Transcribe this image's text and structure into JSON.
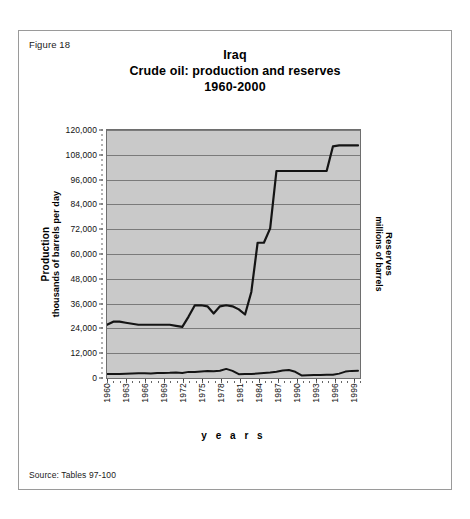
{
  "figure": {
    "label": "Figure 18",
    "source": "Source: Tables 97-100"
  },
  "chart_data": {
    "type": "line",
    "title": "Iraq",
    "subtitle": "Crude oil: production and reserves",
    "period": "1960-2000",
    "xlabel": "y e a r s",
    "ylabel_line1": "Production",
    "ylabel_line2": "thousands of barrels per day",
    "y2label_line1": "Reserves",
    "y2label_line2": "millions of barrels",
    "grid": true,
    "legend": "none",
    "xlim": [
      1960,
      2000
    ],
    "ylim": [
      0,
      120000
    ],
    "ytick_labels": [
      "0",
      "12,000",
      "24,000",
      "36,000",
      "48,000",
      "60,000",
      "72,000",
      "84,000",
      "96,000",
      "108,000",
      "120,000"
    ],
    "ytick_values": [
      0,
      12000,
      24000,
      36000,
      48000,
      60000,
      72000,
      84000,
      96000,
      108000,
      120000
    ],
    "xtick_labels": [
      "1960",
      "1963",
      "1966",
      "1969",
      "1972",
      "1975",
      "1978",
      "1981",
      "1984",
      "1987",
      "1990",
      "1993",
      "1996",
      "1999"
    ],
    "xtick_values": [
      1960,
      1963,
      1966,
      1969,
      1972,
      1975,
      1978,
      1981,
      1984,
      1987,
      1990,
      1993,
      1996,
      1999
    ],
    "x": [
      1960,
      1961,
      1962,
      1963,
      1964,
      1965,
      1966,
      1967,
      1968,
      1969,
      1970,
      1971,
      1972,
      1973,
      1974,
      1975,
      1976,
      1977,
      1978,
      1979,
      1980,
      1981,
      1982,
      1983,
      1984,
      1985,
      1986,
      1987,
      1988,
      1989,
      1990,
      1991,
      1992,
      1993,
      1994,
      1995,
      1996,
      1997,
      1998,
      1999,
      2000
    ],
    "series": [
      {
        "name": "Reserves",
        "axis": "right",
        "units": "millions of barrels",
        "values": [
          25000,
          26500,
          26500,
          26000,
          25500,
          25000,
          25000,
          25000,
          25000,
          25000,
          25000,
          24500,
          24000,
          29000,
          34500,
          34500,
          34000,
          30500,
          34000,
          34500,
          34000,
          32500,
          30000,
          41000,
          65000,
          65000,
          72000,
          100000,
          100000,
          100000,
          100000,
          100000,
          100000,
          100000,
          100000,
          100000,
          112000,
          112500,
          112500,
          112500,
          112500
        ]
      },
      {
        "name": "Production",
        "axis": "left",
        "units": "thousands of barrels per day",
        "values": [
          972,
          1007,
          1010,
          1160,
          1255,
          1313,
          1392,
          1228,
          1502,
          1521,
          1549,
          1694,
          1466,
          2018,
          1971,
          2262,
          2415,
          2348,
          2563,
          3477,
          2514,
          897,
          1012,
          1005,
          1209,
          1433,
          1690,
          2079,
          2685,
          2897,
          2040,
          305,
          425,
          512,
          553,
          560,
          579,
          1166,
          2150,
          2508,
          2571
        ]
      }
    ]
  }
}
